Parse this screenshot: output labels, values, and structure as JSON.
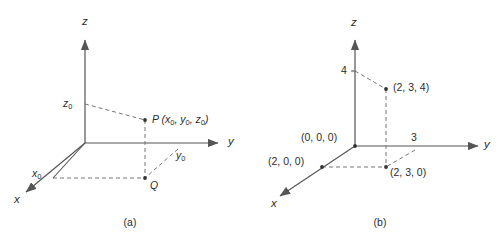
{
  "figure": {
    "background": "#ffffff",
    "line_color": "#555555",
    "dash_color": "#777777",
    "text_color": "#2b2b2b"
  },
  "panel_a": {
    "caption": "(a)",
    "axes": {
      "x_label": "x",
      "y_label": "y",
      "z_label": "z"
    },
    "labels": {
      "x0": "x",
      "x0_sub": "0",
      "y0": "y",
      "y0_sub": "0",
      "z0": "z",
      "z0_sub": "0",
      "point_p": "P (x",
      "point_p_full": "P (x0, y0, z0)",
      "point_q": "Q"
    },
    "point_p_parts": {
      "name": "P",
      "open": " (",
      "x": "x",
      "x_sub": "0",
      "sep1": ", ",
      "y": "y",
      "y_sub": "0",
      "sep2": ", ",
      "z": "z",
      "z_sub": "0",
      "close": ")"
    }
  },
  "panel_b": {
    "caption": "(b)",
    "axes": {
      "x_label": "x",
      "y_label": "y",
      "z_label": "z"
    },
    "ticks": {
      "z_tick": "4",
      "y_tick": "3"
    },
    "points": {
      "origin": "(0, 0, 0)",
      "x_point": "(2, 0, 0)",
      "floor_point": "(2, 3, 0)",
      "space_point": "(2, 3, 4)"
    }
  }
}
